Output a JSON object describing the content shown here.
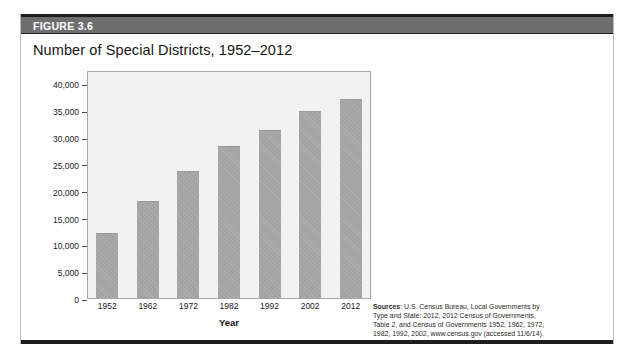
{
  "figure": {
    "header_label": "FIGURE 3.6",
    "title": "Number of Special Districts, 1952–2012"
  },
  "colors": {
    "header_bar": "#6e6e6e",
    "header_text": "#ffffff",
    "plot_background": "#f2f2f2",
    "bar_fill": "#a3a3a3",
    "rule": "#1d1d1d"
  },
  "source": {
    "label": "Sources",
    "line1_rest": ": U.S. Census Bureau, Local Governments by",
    "line2": "Type and State: 2012, 2012 Census of Governments,",
    "line3": "Table 2, and Census of Governments 1952, 1962, 1972,",
    "line4": "1982, 1992, 2002, www.census.gov (accessed 11/6/14)."
  },
  "chart_data": {
    "type": "bar",
    "title": "Number of Special Districts, 1952–2012",
    "xlabel": "Year",
    "ylabel": "",
    "categories": [
      "1952",
      "1962",
      "1972",
      "1982",
      "1992",
      "2002",
      "2012"
    ],
    "values": [
      12340,
      18323,
      23885,
      28588,
      31555,
      35052,
      37203
    ],
    "ylim": [
      0,
      42500
    ],
    "yticks": [
      0,
      5000,
      10000,
      15000,
      20000,
      25000,
      30000,
      35000,
      40000
    ],
    "ytick_labels": [
      "0",
      "5,000",
      "10,000",
      "15,000",
      "20,000",
      "25,000",
      "30,000",
      "35,000",
      "40,000"
    ],
    "grid": false,
    "legend": false
  }
}
